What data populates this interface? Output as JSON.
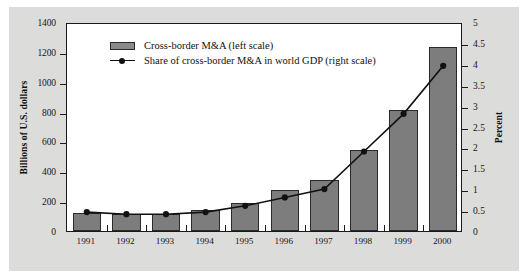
{
  "chart_data": {
    "type": "bar",
    "title": "",
    "categories": [
      "1991",
      "1992",
      "1993",
      "1994",
      "1995",
      "1996",
      "1997",
      "1998",
      "1999",
      "2000"
    ],
    "series": [
      {
        "name": "Cross-border M&A  (left scale)",
        "type": "bar",
        "axis": "left",
        "values": [
          118,
          112,
          115,
          140,
          190,
          275,
          340,
          545,
          810,
          1230
        ]
      },
      {
        "name": "Share of cross-border M&A in world GDP  (right scale)",
        "type": "line",
        "axis": "right",
        "values": [
          0.5,
          0.45,
          0.45,
          0.5,
          0.65,
          0.85,
          1.05,
          1.95,
          2.85,
          4.0
        ]
      }
    ],
    "xlabel": "",
    "ylabel": "Billions of U.S. dollars",
    "ylabel_right": "Percent",
    "ylim": [
      0,
      1400
    ],
    "ylim_right": [
      0,
      5
    ],
    "yticks": [
      0,
      200,
      400,
      600,
      800,
      1000,
      1200,
      1400
    ],
    "yticks_right": [
      0,
      0.5,
      1,
      1.5,
      2,
      2.5,
      3,
      3.5,
      4,
      4.5,
      5
    ],
    "ytick_labels": [
      "0",
      "200",
      "400",
      "600",
      "800",
      "1000",
      "1200",
      "1400"
    ],
    "ytick_labels_right": [
      "0",
      "0.5",
      "1",
      "1.5",
      "2",
      "2.5",
      "3",
      "3.5",
      "4",
      "4.5",
      "5"
    ],
    "grid": false,
    "legend_position": "top-left"
  },
  "legend": {
    "items": [
      {
        "marker": "bar-swatch",
        "label": "Cross-border M&A  (left scale)"
      },
      {
        "marker": "line-marker",
        "label": "Share of cross-border M&A in world GDP  (right scale)"
      }
    ]
  },
  "colors": {
    "bar_fill": "#7d7d7d",
    "bar_stroke": "#2a2a2a",
    "line": "#111111",
    "panel_background": "#dcdcda",
    "plot_background": "#ffffff",
    "axis": "#1a1a1a",
    "text": "#161616"
  }
}
